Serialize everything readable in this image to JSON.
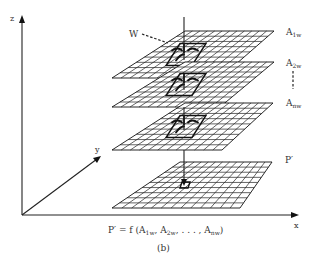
{
  "figure": {
    "caption": "(b)",
    "formula": {
      "lhs": "P′ = f (A",
      "terms": [
        {
          "base": "A",
          "sub": "1w"
        },
        {
          "base": "A",
          "sub": "2w"
        },
        {
          "base": "A",
          "sub": "nw"
        }
      ],
      "text_parts": [
        "P′ = f (A",
        "1w",
        ", A",
        "2w",
        ", . . . , A",
        "nw",
        ")"
      ]
    },
    "axes": {
      "x_label": "x",
      "y_label": "y",
      "z_label": "z"
    },
    "annotations": {
      "window_label": "W"
    },
    "layers": [
      {
        "name": "A",
        "sub": "1w",
        "role": "input"
      },
      {
        "name": "A",
        "sub": "2w",
        "role": "input"
      },
      {
        "name": "A",
        "sub": "nw",
        "role": "input"
      },
      {
        "name": "P′",
        "sub": "",
        "role": "output"
      }
    ],
    "ellipsis_between": "A2w-Anw",
    "colors": {
      "line": "#111111",
      "text": "#333333",
      "background": "#ffffff"
    }
  }
}
